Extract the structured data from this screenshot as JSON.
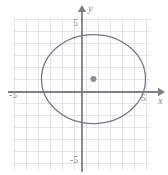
{
  "figure": {
    "width": 168,
    "height": 175,
    "background": "#ffffff"
  },
  "colors": {
    "grid": "#dcdce6",
    "axis": "#7d7d85",
    "curve": "#76767e",
    "center_dot": "#8d8d95",
    "label": "#8a8a8a"
  },
  "axes": {
    "x_label": "x",
    "y_label": "y",
    "x_ticks": [
      {
        "value": -5,
        "label": "-5"
      },
      {
        "value": 5,
        "label": "5"
      }
    ],
    "y_ticks": [
      {
        "value": 5,
        "label": "5"
      },
      {
        "value": -5,
        "label": "-5"
      }
    ],
    "origin_px": {
      "x": 82,
      "y": 92
    },
    "unit_px": 12,
    "x_arrow_tip_px": 164,
    "y_arrow_tip_px": 6
  },
  "grid": {
    "visible": true,
    "spacing_px": 12,
    "left_px": 14,
    "right_px": 150,
    "top_px": 19,
    "bottom_px": 170
  },
  "chart_data": {
    "type": "scatter",
    "title": "",
    "xlabel": "x",
    "ylabel": "y",
    "xlim": [
      -5.7,
      6.8
    ],
    "ylim": [
      -6.5,
      6.2
    ],
    "grid": true,
    "legend": "none",
    "annotations": [],
    "shapes": [
      {
        "kind": "ellipse",
        "center": {
          "x": 0.95,
          "y": 1.1
        },
        "semi_axis_x": 4.35,
        "semi_axis_y": 3.7,
        "stroke": "#76767e",
        "fill": "none",
        "center_px": {
          "x": 93.5,
          "y": 79
        },
        "radius_px": {
          "rx": 52,
          "ry": 44.5
        }
      }
    ],
    "points": [
      {
        "name": "ellipse-center",
        "x": 0.95,
        "y": 1.1,
        "px": {
          "x": 93.5,
          "y": 79
        },
        "marker": "filled-circle",
        "radius_px": 3
      }
    ]
  }
}
